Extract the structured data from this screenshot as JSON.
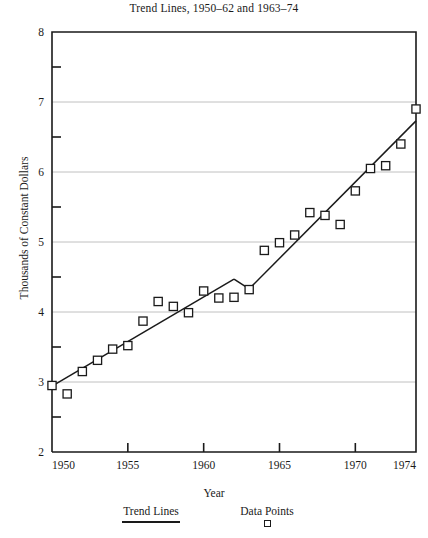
{
  "chart_data": {
    "type": "scatter",
    "title": "Trend Lines, 1950–62 and 1963–74",
    "xlabel": "Year",
    "ylabel": "Thousands of Constant Dollars",
    "xlim": [
      1950,
      1974
    ],
    "ylim": [
      2,
      8
    ],
    "grid": true,
    "xticks": [
      1950,
      1955,
      1960,
      1965,
      1970,
      1974
    ],
    "xtick_labels": [
      "1950",
      "1955",
      "1960",
      "1965",
      "1970",
      "1974"
    ],
    "yticks": [
      2,
      3,
      4,
      5,
      6,
      7,
      8
    ],
    "ytick_labels": [
      "2",
      "3",
      "4",
      "5",
      "6",
      "7",
      "8"
    ],
    "yminor_ticks": [
      2.5,
      3.5,
      4.5,
      5.5,
      6.5,
      7.5
    ],
    "legend_position": "bottom",
    "series": [
      {
        "name": "Data Points",
        "type": "scatter",
        "marker": "open-square",
        "x": [
          1950,
          1951,
          1952,
          1953,
          1954,
          1955,
          1956,
          1957,
          1958,
          1959,
          1960,
          1961,
          1962,
          1963,
          1964,
          1965,
          1966,
          1967,
          1968,
          1969,
          1970,
          1971,
          1972,
          1973,
          1974
        ],
        "values": [
          2.95,
          2.83,
          3.15,
          3.31,
          3.47,
          3.52,
          3.87,
          4.15,
          4.08,
          3.99,
          4.3,
          4.2,
          4.21,
          4.32,
          4.88,
          4.99,
          5.1,
          5.42,
          5.38,
          5.25,
          5.73,
          6.05,
          6.09,
          6.4,
          6.9
        ]
      },
      {
        "name": "Trend Lines",
        "type": "line",
        "segments": [
          {
            "label": "1950–62",
            "x": [
              1950,
              1962
            ],
            "y": [
              2.94,
              4.47
            ]
          },
          {
            "label": "1963–74",
            "x": [
              1963,
              1974
            ],
            "y": [
              4.33,
              6.73
            ]
          }
        ]
      }
    ],
    "legend": [
      {
        "label": "Trend Lines",
        "marker": "line"
      },
      {
        "label": "Data Points",
        "marker": "open-square"
      }
    ],
    "colors": {
      "line": "#1a1a1a",
      "marker_edge": "#1a1a1a",
      "marker_face": "#ffffff",
      "grid": "#b9b9b9",
      "axis": "#1a1a1a",
      "background": "#ffffff"
    }
  }
}
